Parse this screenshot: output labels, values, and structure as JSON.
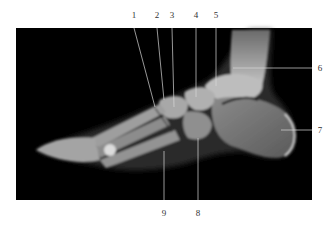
{
  "figure": {
    "type": "lateral foot radiograph",
    "background_color": "#ffffff",
    "image_background": "#000000",
    "leader_color": "#d8d8d8",
    "label_color": "#333333"
  },
  "labels": [
    {
      "id": "1",
      "text": "1",
      "x": 134,
      "y": 18
    },
    {
      "id": "2",
      "text": "2",
      "x": 157,
      "y": 18
    },
    {
      "id": "3",
      "text": "3",
      "x": 172,
      "y": 18
    },
    {
      "id": "4",
      "text": "4",
      "x": 196,
      "y": 18
    },
    {
      "id": "5",
      "text": "5",
      "x": 216,
      "y": 18
    },
    {
      "id": "6",
      "text": "6",
      "x": 320,
      "y": 71
    },
    {
      "id": "7",
      "text": "7",
      "x": 320,
      "y": 133
    },
    {
      "id": "8",
      "text": "8",
      "x": 198,
      "y": 216
    },
    {
      "id": "9",
      "text": "9",
      "x": 164,
      "y": 216
    }
  ]
}
